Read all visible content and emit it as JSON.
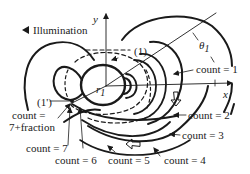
{
  "diagram": {
    "illumination_label": "Illumination",
    "axes": {
      "x_label": "x",
      "y_label": "y"
    },
    "angle_label": "θ",
    "angle_subscript": "1",
    "radius_label": "r",
    "radius_subscript": "1",
    "point_labels": {
      "p1": "(1)",
      "p1_prime": "(1')"
    },
    "count_labels": [
      {
        "id": "c1",
        "text": "count = 1"
      },
      {
        "id": "c2",
        "text": "count = 2"
      },
      {
        "id": "c3",
        "text": "count = 3"
      },
      {
        "id": "c4",
        "text": "count = 4"
      },
      {
        "id": "c5",
        "text": "count = 5"
      },
      {
        "id": "c6",
        "text": "count = 6"
      },
      {
        "id": "c7",
        "text": "count = 7"
      }
    ],
    "count_fraction": {
      "line1": "count =",
      "line2": "7+fraction"
    },
    "colors": {
      "stroke": "#1a1a1a",
      "background": "#ffffff"
    }
  }
}
